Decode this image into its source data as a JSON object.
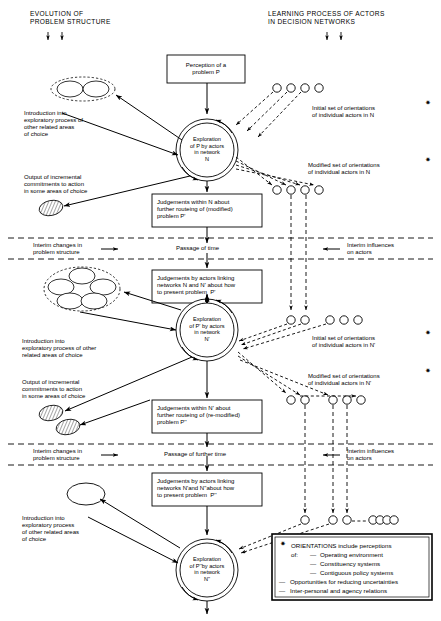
{
  "figure": {
    "headers": {
      "left": "EVOLUTION OF\nPROBLEM STRUCTURE",
      "right": "LEARNING PROCESS OF ACTORS\nIN DECISION NETWORKS"
    },
    "boxes": [
      {
        "id": "perception",
        "text": "Perception of a\nproblem P"
      },
      {
        "id": "judgements-n",
        "text": "Judgements within N about\nfurther routeing of (modified)\nproblem P'"
      },
      {
        "id": "judgements-link-n-n1",
        "text": "Judgements by actors linking\nnetworks N and N' about how\nto present problem  P'"
      },
      {
        "id": "judgements-n1",
        "text": "Judgements within N' about\nfurther routeing of (re-modified)\nproblem P''"
      },
      {
        "id": "judgements-link-n1-n2",
        "text": "Judgements by actors linking\nnetworks N'and N''about how\nto present problem  P''"
      }
    ],
    "explorations": [
      {
        "id": "exploration-n",
        "text": "Exploration\nof P by actors\nin network\nN"
      },
      {
        "id": "exploration-n1",
        "text": "Exploration\nof P' by actors\nin network\nN'"
      },
      {
        "id": "exploration-n2",
        "text": "Exploration\nof P''by actors\nin network\nN''"
      }
    ],
    "left_captions": [
      {
        "id": "intro-1",
        "text": "Introduction into\nexploratory process of\nother related areas\nof choice"
      },
      {
        "id": "output-1",
        "text": "Output of incremental\ncommitments to action\nin some areas of choice"
      },
      {
        "id": "intro-2",
        "text": "Introduction into\nexploratory process of other\nrelated areas of choice"
      },
      {
        "id": "output-2",
        "text": "Output of incremental\ncommitments to action\nin some areas of choice"
      },
      {
        "id": "intro-3",
        "text": "Introduction into\nexploratory process\nof other related areas\nof choice"
      }
    ],
    "right_captions": [
      {
        "id": "initial-n",
        "text": "Initial set of orientations\nof individual actors in N",
        "star": "✷"
      },
      {
        "id": "modified-n",
        "text": "Modified set of orientations\nof individual actors in N",
        "star": "✷"
      },
      {
        "id": "initial-n1",
        "text": "Initial set of orientations\nof individual actors in N'",
        "star": "✷"
      },
      {
        "id": "modified-n1",
        "text": "Modified set of orientations\nof individual actors in N'",
        "star": "✷"
      }
    ],
    "time_bands": [
      {
        "id": "band-1",
        "left": "Interim changes in\nproblem structure",
        "center": "Passage of time",
        "right": "Interim influences\non actors"
      },
      {
        "id": "band-2",
        "left": "Interim changes in\nproblem structure",
        "center": "Passage of further time",
        "right": "Interim influences\non actors"
      }
    ],
    "legend": {
      "star": "✷",
      "title": "ORIENTATIONS include perceptions",
      "of_label": "of:",
      "items": [
        "Operating environment",
        "Constituency systems",
        "Contiguous policy systems"
      ],
      "extra": [
        "Opportunities for reducing uncertainties",
        "Inter-personal and agency relations"
      ],
      "dash": "—"
    },
    "colors": {
      "ink": "#000000",
      "paper": "#ffffff"
    }
  }
}
